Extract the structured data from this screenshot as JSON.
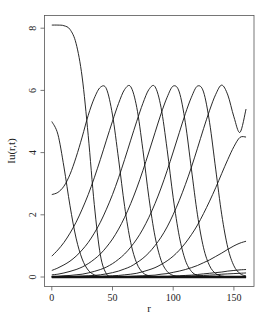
{
  "chart_data": {
    "type": "line",
    "title": "",
    "xlabel": "r",
    "ylabel": "Iu(r,t)",
    "xlim": [
      -6,
      166
    ],
    "ylim": [
      -0.3,
      8.5
    ],
    "x_ticks": [
      0,
      50,
      100,
      150
    ],
    "y_ticks": [
      0,
      2,
      4,
      6,
      8
    ],
    "grid": false,
    "legend": null,
    "x": [
      0,
      5,
      10,
      15,
      20,
      25,
      30,
      35,
      40,
      45,
      50,
      55,
      60,
      65,
      70,
      75,
      80,
      85,
      90,
      95,
      100,
      105,
      110,
      115,
      120,
      125,
      130,
      135,
      140,
      145,
      150,
      155,
      160
    ],
    "series": [
      {
        "name": "t0",
        "values": [
          8.1,
          8.1,
          8.08,
          7.96,
          7.51,
          6.43,
          4.55,
          2.33,
          0.71,
          0.1,
          0.01,
          0,
          0,
          0,
          0,
          0,
          0,
          0,
          0,
          0,
          0,
          0,
          0,
          0,
          0,
          0,
          0,
          0,
          0,
          0,
          0,
          0,
          0
        ]
      },
      {
        "name": "t1",
        "values": [
          5.0,
          4.59,
          3.54,
          2.29,
          1.25,
          0.58,
          0.22,
          0.07,
          0.02,
          0,
          0,
          0,
          0,
          0,
          0,
          0,
          0,
          0,
          0,
          0,
          0,
          0,
          0,
          0,
          0,
          0,
          0,
          0,
          0,
          0,
          0,
          0,
          0
        ]
      },
      {
        "name": "t2",
        "values": [
          2.65,
          2.72,
          2.92,
          3.3,
          3.85,
          4.5,
          5.2,
          5.75,
          6.1,
          6.05,
          5.21,
          3.79,
          2.27,
          1.11,
          0.44,
          0.14,
          0.04,
          0.01,
          0,
          0,
          0,
          0,
          0,
          0,
          0,
          0,
          0,
          0,
          0,
          0,
          0,
          0,
          0
        ]
      },
      {
        "name": "t3",
        "values": [
          0.67,
          0.87,
          1.11,
          1.41,
          1.76,
          2.18,
          2.65,
          3.19,
          3.78,
          4.4,
          5.01,
          5.58,
          6.03,
          6.12,
          5.45,
          4.1,
          2.55,
          1.31,
          0.54,
          0.18,
          0.05,
          0.01,
          0,
          0,
          0,
          0,
          0,
          0,
          0,
          0,
          0,
          0,
          0
        ]
      },
      {
        "name": "t4",
        "values": [
          0.21,
          0.29,
          0.39,
          0.51,
          0.67,
          0.87,
          1.11,
          1.41,
          1.76,
          2.18,
          2.65,
          3.19,
          3.78,
          4.4,
          5.01,
          5.58,
          6.03,
          6.12,
          5.45,
          4.1,
          2.55,
          1.31,
          0.54,
          0.18,
          0.05,
          0.01,
          0,
          0,
          0,
          0,
          0,
          0,
          0
        ]
      },
      {
        "name": "t5",
        "values": [
          0.07,
          0.09,
          0.13,
          0.18,
          0.24,
          0.32,
          0.43,
          0.57,
          0.74,
          0.96,
          1.22,
          1.54,
          1.92,
          2.36,
          2.86,
          3.42,
          4.02,
          4.64,
          5.25,
          5.78,
          6.14,
          5.95,
          4.96,
          3.47,
          2.0,
          0.94,
          0.36,
          0.11,
          0.03,
          0.01,
          0,
          0,
          0
        ]
      },
      {
        "name": "t6",
        "values": [
          0.02,
          0.02,
          0.04,
          0.05,
          0.07,
          0.09,
          0.13,
          0.18,
          0.24,
          0.32,
          0.43,
          0.57,
          0.74,
          0.96,
          1.22,
          1.54,
          1.92,
          2.36,
          2.86,
          3.42,
          4.02,
          4.64,
          5.25,
          5.78,
          6.14,
          5.95,
          4.96,
          3.47,
          2.0,
          0.94,
          0.36,
          0.11,
          0.03
        ]
      },
      {
        "name": "t7",
        "values": [
          0.01,
          0.01,
          0.01,
          0.01,
          0.02,
          0.03,
          0.04,
          0.05,
          0.07,
          0.1,
          0.14,
          0.19,
          0.26,
          0.34,
          0.46,
          0.6,
          0.78,
          1.01,
          1.28,
          1.61,
          2.01,
          2.46,
          2.97,
          3.53,
          4.14,
          4.77,
          5.36,
          5.87,
          6.17,
          5.85,
          5.15,
          4.65,
          5.4
        ]
      },
      {
        "name": "t8",
        "values": [
          0,
          0,
          0,
          0.01,
          0.01,
          0.01,
          0.01,
          0.02,
          0.02,
          0.03,
          0.04,
          0.05,
          0.07,
          0.09,
          0.12,
          0.17,
          0.23,
          0.3,
          0.4,
          0.52,
          0.67,
          0.86,
          1.09,
          1.36,
          1.67,
          2.04,
          2.44,
          2.87,
          3.33,
          3.78,
          4.19,
          4.49,
          4.5
        ]
      },
      {
        "name": "t9",
        "values": [
          0,
          0,
          0,
          0,
          0,
          0,
          0,
          0,
          0,
          0,
          0.01,
          0.01,
          0.01,
          0.02,
          0.03,
          0.04,
          0.05,
          0.06,
          0.09,
          0.11,
          0.15,
          0.19,
          0.24,
          0.3,
          0.37,
          0.46,
          0.55,
          0.66,
          0.77,
          0.89,
          1.0,
          1.09,
          1.15
        ]
      },
      {
        "name": "t10",
        "values": [
          0,
          0,
          0,
          0,
          0,
          0,
          0,
          0,
          0,
          0,
          0,
          0,
          0,
          0,
          0.01,
          0.01,
          0.01,
          0.01,
          0.02,
          0.02,
          0.03,
          0.04,
          0.05,
          0.06,
          0.08,
          0.1,
          0.12,
          0.14,
          0.16,
          0.19,
          0.21,
          0.23,
          0.24
        ]
      },
      {
        "name": "t11",
        "values": [
          0,
          0,
          0,
          0,
          0,
          0,
          0,
          0,
          0,
          0,
          0,
          0,
          0,
          0,
          0,
          0,
          0.01,
          0.01,
          0.01,
          0.01,
          0.02,
          0.02,
          0.03,
          0.03,
          0.04,
          0.05,
          0.06,
          0.07,
          0.09,
          0.1,
          0.11,
          0.12,
          0.13
        ]
      },
      {
        "name": "t12",
        "values": [
          0,
          0,
          0,
          0,
          0,
          0,
          0,
          0,
          0,
          0,
          0,
          0,
          0,
          0,
          0,
          0,
          0,
          0,
          0,
          0,
          0,
          0,
          0,
          0,
          0,
          0,
          0,
          0,
          0,
          0,
          0,
          0,
          0
        ]
      }
    ]
  },
  "colors": {
    "line": "#111111",
    "frame": "#555555",
    "background": "#ffffff"
  }
}
